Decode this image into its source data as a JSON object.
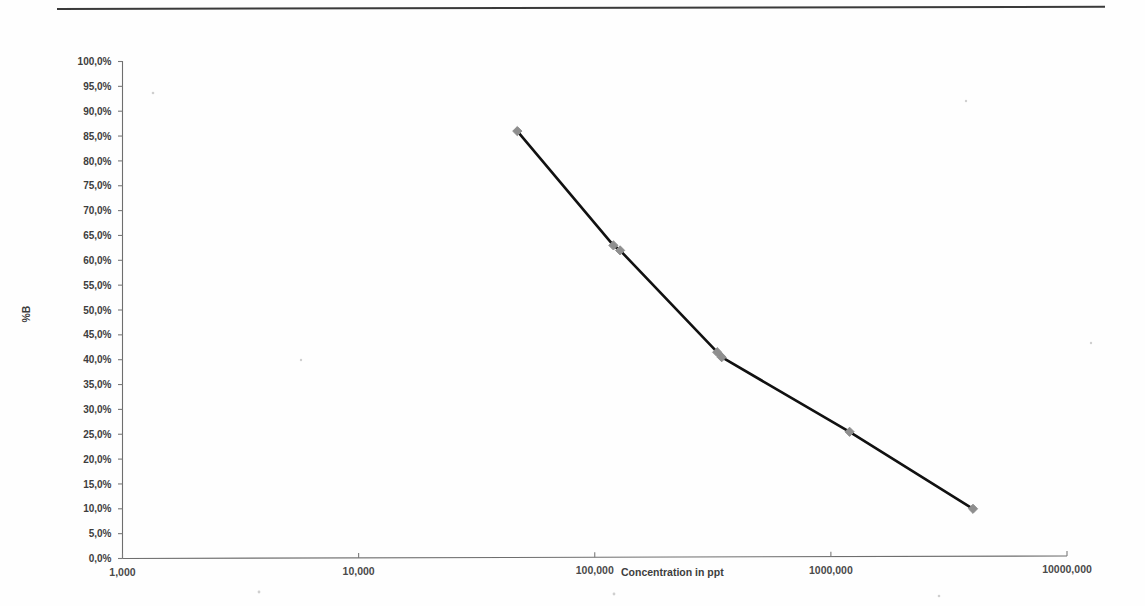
{
  "document": {
    "rule_present": true
  },
  "chart_data": {
    "type": "line",
    "title": "",
    "subtitle": "",
    "xlabel": "Concentration in ppt",
    "ylabel": "%B",
    "xscale": "log",
    "yscale": "linear",
    "grid": false,
    "legend": false,
    "legend_position": "none",
    "xlim": [
      1000,
      10000000
    ],
    "ylim": [
      0,
      100
    ],
    "x_tick_labels": [
      "1,000",
      "10,000",
      "100,000",
      "1000,000",
      "10000,000"
    ],
    "x_tick_values": [
      1000,
      10000,
      100000,
      1000000,
      10000000
    ],
    "y_tick_labels": [
      "0,0%",
      "5,0%",
      "10,0%",
      "15,0%",
      "20,0%",
      "25,0%",
      "30,0%",
      "35,0%",
      "40,0%",
      "45,0%",
      "50,0%",
      "55,0%",
      "60,0%",
      "65,0%",
      "70,0%",
      "75,0%",
      "80,0%",
      "85,0%",
      "90,0%",
      "95,0%",
      "100,0%"
    ],
    "y_tick_values": [
      0,
      5,
      10,
      15,
      20,
      25,
      30,
      35,
      40,
      45,
      50,
      55,
      60,
      65,
      70,
      75,
      80,
      85,
      90,
      95,
      100
    ],
    "series": [
      {
        "name": "%B",
        "marker": "diamond",
        "marker_color": "#8e8e8e",
        "line_color": "#111111",
        "x": [
          47000,
          120000,
          128000,
          330000,
          345000,
          1200000,
          4000000
        ],
        "y": [
          86.0,
          63.0,
          62.0,
          41.5,
          40.5,
          25.5,
          10.0
        ]
      }
    ],
    "annotations": []
  },
  "colors": {
    "line": "#111111",
    "marker": "#8e8e8e",
    "axis": "#6e6e6e",
    "text": "#3d3d3d",
    "background": "#ffffff"
  }
}
